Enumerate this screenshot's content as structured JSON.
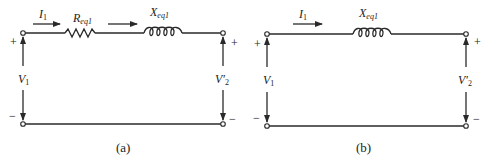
{
  "figure": {
    "panels": [
      {
        "id": "a",
        "caption": "(a)",
        "current_label": "I",
        "current_sub": "1",
        "resistor_label": "R",
        "resistor_sub": "eq1",
        "reactance_label": "X",
        "reactance_sub": "eq1",
        "input_voltage_label": "V",
        "input_voltage_sub": "1",
        "output_voltage_label": "V′",
        "output_voltage_sub": "2",
        "plus": "+",
        "minus": "−"
      },
      {
        "id": "b",
        "caption": "(b)",
        "current_label": "I",
        "current_sub": "1",
        "reactance_label": "X",
        "reactance_sub": "eq1",
        "input_voltage_label": "V",
        "input_voltage_sub": "1",
        "output_voltage_label": "V′",
        "output_voltage_sub": "2",
        "plus": "+",
        "minus": "−"
      }
    ],
    "colors": {
      "line": "#2a2a2a",
      "background": "#ffffff"
    }
  }
}
